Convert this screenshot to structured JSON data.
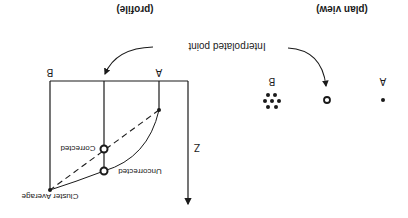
{
  "figure": {
    "orientation": "rotated 180 degrees",
    "colors": {
      "ink": "#1a1a1a",
      "background": "#ffffff"
    },
    "plan_view": {
      "caption": "(plan view)",
      "point_a_label": "A",
      "point_b_label": "B"
    },
    "profile": {
      "caption": "(profile)",
      "point_a_label": "A",
      "point_b_label": "B",
      "axis_label": "Z",
      "corrected_label": "Corrected",
      "uncorrected_label": "Uncorrected",
      "cluster_average_label": "Cluster Average"
    },
    "shared": {
      "interpolated_label": "Interpolated point"
    }
  }
}
